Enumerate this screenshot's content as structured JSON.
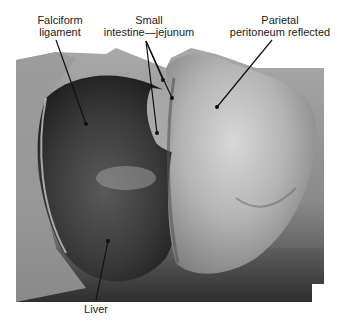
{
  "figure": {
    "type": "anatomical-photograph",
    "colormode": "grayscale",
    "labels": [
      {
        "id": "falciform",
        "lines": [
          "Falciform",
          "ligament"
        ]
      },
      {
        "id": "small-intestine",
        "lines": [
          "Small",
          "intestine—jejunum"
        ]
      },
      {
        "id": "parietal",
        "lines": [
          "Parietal",
          "peritoneum reflected"
        ]
      },
      {
        "id": "liver",
        "lines": [
          "Liver"
        ]
      }
    ],
    "leader_lines": [
      {
        "label": "falciform",
        "from": [
          56,
          40
        ],
        "to": [
          86,
          124
        ]
      },
      {
        "label": "small-intestine",
        "from": [
          146,
          41
        ],
        "to": [
          157,
          133
        ]
      },
      {
        "label": "small-intestine",
        "from": [
          146,
          41
        ],
        "to": [
          163,
          80
        ]
      },
      {
        "label": "small-intestine",
        "from": [
          146,
          41
        ],
        "to": [
          172,
          98
        ]
      },
      {
        "label": "parietal",
        "from": [
          272,
          40
        ],
        "to": [
          217,
          107
        ]
      },
      {
        "label": "liver",
        "from": [
          96,
          300
        ],
        "to": [
          108,
          241
        ]
      }
    ]
  }
}
